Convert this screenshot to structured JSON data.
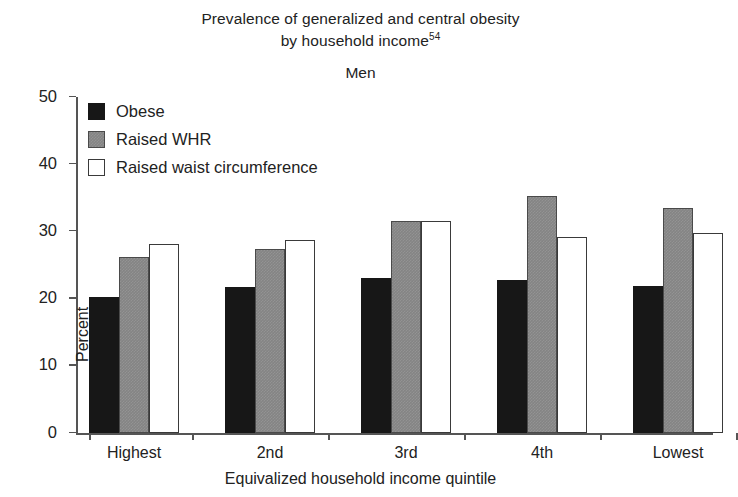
{
  "figure": {
    "title_line1": "Prevalence of generalized and central obesity",
    "title_line2": "by household income",
    "title_superscript": "54",
    "subtitle": "Men"
  },
  "axes": {
    "ylabel": "Percent",
    "xlabel": "Equivalized household income quintile",
    "yticks": [
      "50",
      "40",
      "30",
      "20",
      "10",
      "0"
    ]
  },
  "legend": {
    "items": [
      {
        "label": "Obese",
        "swatch": "black-square-swatch",
        "color": "#171717"
      },
      {
        "label": "Raised WHR",
        "swatch": "gray-square-swatch",
        "color": "#848484"
      },
      {
        "label": "Raised waist circumference",
        "swatch": "white-square-swatch",
        "color": "#ffffff"
      }
    ]
  },
  "chart_data": {
    "type": "bar",
    "xlabel": "Equivalized household income quintile",
    "ylabel": "Percent",
    "ylim": [
      0,
      50
    ],
    "yticks": [
      0,
      10,
      20,
      30,
      40,
      50
    ],
    "grid": false,
    "legend_position": "top-left inside axes",
    "categories": [
      "Highest",
      "2nd",
      "3rd",
      "4th",
      "Lowest"
    ],
    "series": [
      {
        "name": "Obese",
        "color": "#171717",
        "values": [
          20.2,
          21.7,
          23.1,
          22.8,
          21.9
        ]
      },
      {
        "name": "Raised WHR",
        "color": "#848484",
        "values": [
          26.2,
          27.4,
          31.5,
          35.3,
          33.5
        ]
      },
      {
        "name": "Raised waist circumference",
        "color": "#ffffff",
        "values": [
          28.1,
          28.7,
          31.6,
          29.1,
          29.8
        ]
      }
    ]
  }
}
